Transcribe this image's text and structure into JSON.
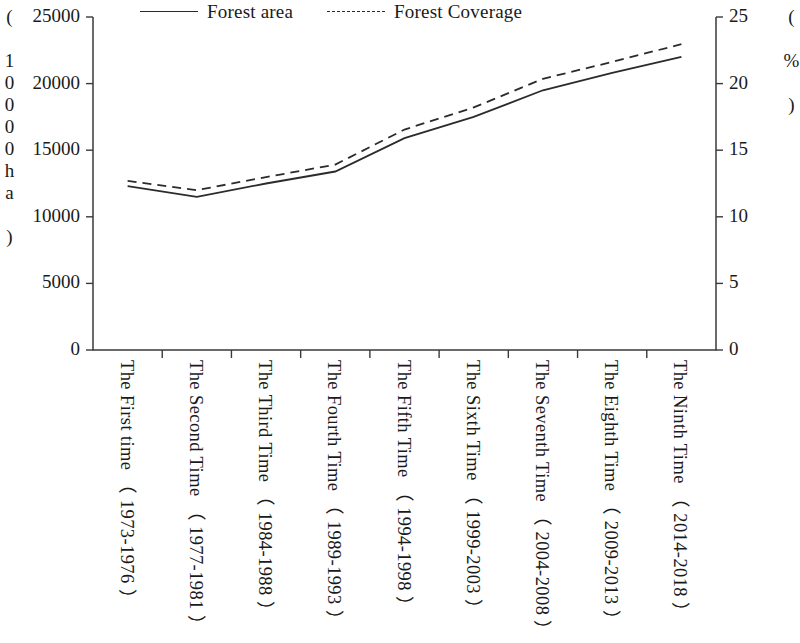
{
  "chart_data": {
    "type": "line",
    "title": "",
    "xlabel": "",
    "ylabel": "( 10000ha )",
    "y2label": "( % )",
    "grid": false,
    "legend_position": "top",
    "ylim": [
      0,
      25000
    ],
    "y2lim": [
      0,
      25
    ],
    "yticks": [
      "0",
      "5000",
      "10000",
      "15000",
      "20000",
      "25000"
    ],
    "y2ticks": [
      "0",
      "5",
      "10",
      "15",
      "20",
      "25"
    ],
    "categories": [
      "The First time （ 1973-1976 ）",
      "The Second Time （ 1977-1981 ）",
      "The Third Time （ 1984-1988 ）",
      "The Fourth Time （ 1989-1993 ）",
      "The Fifth Time （ 1994-1998 ）",
      "The Sixth Time （ 1999-2003 ）",
      "The Seventh Time （ 2004-2008 ）",
      "The Eighth Time （ 2009-2013 ）",
      "The Ninth Time （ 2014-2018 ）"
    ],
    "series": [
      {
        "name": "Forest area",
        "style": "solid",
        "axis": "left",
        "values": [
          12300,
          11500,
          12500,
          13400,
          15900,
          17500,
          19500,
          20800,
          22000
        ]
      },
      {
        "name": "Forest Coverage",
        "style": "dashed",
        "axis": "right",
        "values": [
          12.7,
          12.0,
          12.98,
          13.92,
          16.55,
          18.21,
          20.36,
          21.63,
          22.96
        ]
      }
    ]
  },
  "legend": {
    "items": [
      {
        "label": "Forest area",
        "style": "solid"
      },
      {
        "label": "Forest Coverage",
        "style": "dashed"
      }
    ]
  },
  "colors": {
    "line": "#2b2b2b",
    "axis": "#3a3a3a",
    "background": "#ffffff"
  }
}
